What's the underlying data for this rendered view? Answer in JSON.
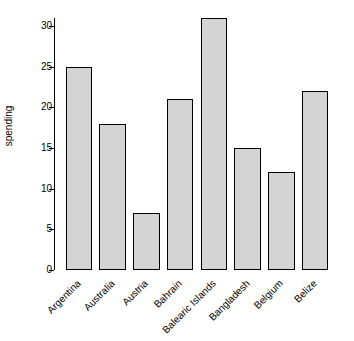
{
  "chart_data": {
    "type": "bar",
    "title": "",
    "subtitle": "",
    "xlabel": "",
    "ylabel": "spending",
    "categories": [
      "Argentina",
      "Australia",
      "Austria",
      "Bahrain",
      "Balearic Islands",
      "Bangladesh",
      "Belgium",
      "Belize"
    ],
    "values": [
      25,
      18,
      7,
      21,
      31,
      15,
      12,
      22
    ],
    "ylim": [
      0,
      31
    ],
    "yticks": [
      0,
      5,
      10,
      15,
      20,
      25,
      30
    ],
    "ytick_labels": [
      "0",
      "5",
      "10",
      "15",
      "20",
      "25",
      "30"
    ],
    "grid": false,
    "legend": null,
    "bar_fill": "#d4d4d4",
    "bar_border": "#000000",
    "axis_color": "#000000",
    "background": "#ffffff"
  }
}
